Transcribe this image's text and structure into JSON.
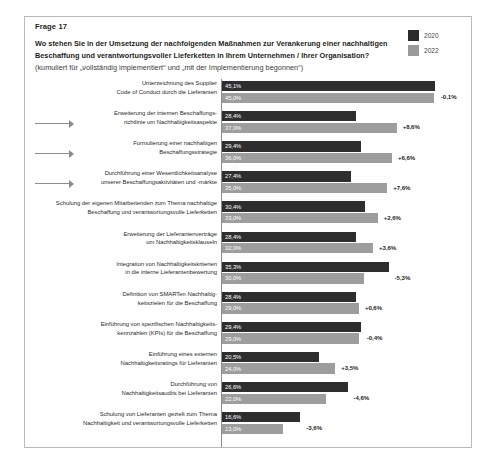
{
  "card": {
    "question_label": "Frage 17",
    "question_title": "Wo stehen Sie in der Umsetzung der nachfolgenden Maßnahmen zur Verankerung einer nachhaltigen Beschaffung und verantwortungsvoller Lieferketten in Ihrem Unternehmen / Ihrer Organisation?",
    "question_subtitle": "(kumuliert für „vollständig implementiert“ und „mit der Implementierung begonnen“)"
  },
  "legend": {
    "items": [
      {
        "label": "2020",
        "color": "#2b2b2b",
        "swatch": "dark"
      },
      {
        "label": "2022",
        "color": "#9a9a9a",
        "swatch": "light"
      }
    ]
  },
  "chart_data": {
    "type": "bar",
    "orientation": "horizontal",
    "grouped": true,
    "title": "Wo stehen Sie in der Umsetzung der nachfolgenden Maßnahmen zur Verankerung einer nachhaltigen Beschaffung und verantwortungsvoller Lieferketten in Ihrem Unternehmen / Ihrer Organisation?",
    "subtitle": "(kumuliert für „vollständig implementiert“ und „mit der Implementierung begonnen“)",
    "xlabel": "",
    "ylabel": "",
    "xlim": [
      0,
      50
    ],
    "grid": false,
    "legend_position": "top-right",
    "value_suffix": "%",
    "decimal_separator": ",",
    "categories": [
      "Unterzeichnung des Supplier Code of Conduct durch die Lieferanten",
      "Erweiterung der internen Beschaffungsrichtlinie um Nachhaltigkeitsaspekte",
      "Formulierung einer nachhaltigen Beschaffungsstrategie",
      "Durchführung einer Wesentlichkeitsanalyse unserer Beschaffungsaktivitäten und -märkte",
      "Schulung der eigenen Mitarbeitenden zum Thema nachhaltige Beschaffung und verantwortungsvolle Lieferketten",
      "Erweiterung der Lieferantenverträge um Nachhaltigkeitsklauseln",
      "Integration von Nachhaltigkeitskriterien in die interne Lieferantenbewertung",
      "Definition von SMARTen Nachhaltigkeitszielen für die Beschaffung",
      "Einführung von spezifischen Nachhaltigkeitskennzahlen (KPIs) für die Beschaffung",
      "Einführung eines externen Nachhaltigkeitsratings für Lieferanten",
      "Durchführung von Nachhaltigkeitsaudits bei Lieferanten",
      "Schulung von Lieferanten gezielt zum Thema Nachhaltigkeit und verantwortungsvolle Lieferketten"
    ],
    "series": [
      {
        "name": "2020",
        "color": "#2e2e2e",
        "values": [
          45.1,
          28.4,
          29.4,
          27.4,
          30.4,
          28.4,
          35.3,
          28.4,
          29.4,
          20.5,
          26.6,
          16.6
        ]
      },
      {
        "name": "2022",
        "color": "#9d9d9d",
        "values": [
          45.0,
          37.0,
          36.0,
          35.0,
          33.0,
          32.0,
          30.0,
          29.0,
          29.0,
          24.0,
          22.0,
          13.0
        ]
      }
    ],
    "deltas": [
      "-0,1%",
      "+8,6%",
      "+6,6%",
      "+7,6%",
      "+2,6%",
      "+3,6%",
      "-5,3%",
      "+0,6%",
      "-0,4%",
      "+3,5%",
      "-4,6%",
      "-3,6%"
    ],
    "highlighted_rows": [
      1,
      2,
      3
    ]
  },
  "rows": [
    {
      "label_lines": [
        "Unterzeichnung des Supplier",
        "Code of Conduct durch die Lieferanten"
      ],
      "v2020": 45.1,
      "v2022": 45.0,
      "v2020_text": "45,1%",
      "v2022_text": "45,0%",
      "delta": "-0,1%",
      "arrow": false
    },
    {
      "label_lines": [
        "Erweiterung der internen Beschaffungs-",
        "richtlinie um Nachhaltigkeitsaspekte"
      ],
      "v2020": 28.4,
      "v2022": 37.0,
      "v2020_text": "28,4%",
      "v2022_text": "37,0%",
      "delta": "+8,6%",
      "arrow": true
    },
    {
      "label_lines": [
        "Formulierung einer nachhaltigen",
        "Beschaffungsstrategie"
      ],
      "v2020": 29.4,
      "v2022": 36.0,
      "v2020_text": "29,4%",
      "v2022_text": "36,0%",
      "delta": "+6,6%",
      "arrow": true
    },
    {
      "label_lines": [
        "Durchführung einer Wesentlichkeitsanalyse",
        "unserer Beschaffungsaktivitäten und -märkte"
      ],
      "v2020": 27.4,
      "v2022": 35.0,
      "v2020_text": "27,4%",
      "v2022_text": "35,0%",
      "delta": "+7,6%",
      "arrow": true
    },
    {
      "label_lines": [
        "Schulung der eigenen Mitarbeitenden zum Thema nachhaltige",
        "Beschaffung und verantwortungsvolle Lieferketten"
      ],
      "v2020": 30.4,
      "v2022": 33.0,
      "v2020_text": "30,4%",
      "v2022_text": "33,0%",
      "delta": "+2,6%",
      "arrow": false
    },
    {
      "label_lines": [
        "Erweiterung der Lieferantenverträge",
        "um Nachhaltigkeitsklauseln"
      ],
      "v2020": 28.4,
      "v2022": 32.0,
      "v2020_text": "28,4%",
      "v2022_text": "32,0%",
      "delta": "+3,6%",
      "arrow": false
    },
    {
      "label_lines": [
        "Integration von Nachhaltigkeitskriterien",
        "in die interne Lieferantenbewertung"
      ],
      "v2020": 35.3,
      "v2022": 30.0,
      "v2020_text": "35,3%",
      "v2022_text": "30,0%",
      "delta": "-5,3%",
      "arrow": false
    },
    {
      "label_lines": [
        "Definition von SMARTen Nachhaltig-",
        "keitszielen für die Beschaffung"
      ],
      "v2020": 28.4,
      "v2022": 29.0,
      "v2020_text": "28,4%",
      "v2022_text": "29,0%",
      "delta": "+0,6%",
      "arrow": false
    },
    {
      "label_lines": [
        "Einführung von spezifischen Nachhaltigkeits-",
        "kennzahlen (KPIs) für die Beschaffung"
      ],
      "v2020": 29.4,
      "v2022": 29.0,
      "v2020_text": "29,4%",
      "v2022_text": "29,0%",
      "delta": "-0,4%",
      "arrow": false
    },
    {
      "label_lines": [
        "Einführung eines externen",
        "Nachhaltigkeitsratings für Lieferanten"
      ],
      "v2020": 20.5,
      "v2022": 24.0,
      "v2020_text": "20,5%",
      "v2022_text": "24,0%",
      "delta": "+3,5%",
      "arrow": false
    },
    {
      "label_lines": [
        "Durchführung von",
        "Nachhaltigkeitsaudits bei Lieferanten"
      ],
      "v2020": 26.6,
      "v2022": 22.0,
      "v2020_text": "26,6%",
      "v2022_text": "22,0%",
      "delta": "-4,6%",
      "arrow": false
    },
    {
      "label_lines": [
        "Schulung von Lieferanten gezielt zum Thema",
        "Nachhaltigkeit und verantwortungsvolle Lieferketten"
      ],
      "v2020": 16.6,
      "v2022": 13.0,
      "v2020_text": "16,6%",
      "v2022_text": "13,0%",
      "delta": "-3,6%",
      "arrow": false
    }
  ]
}
